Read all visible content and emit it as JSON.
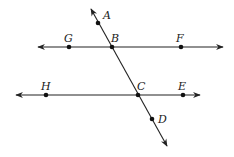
{
  "diagram": {
    "title": "",
    "colors": {
      "line": "#222222",
      "point": "#111111",
      "background": "#ffffff"
    },
    "lines": [
      {
        "id": "line-GF",
        "from": [
          38,
          47
        ],
        "to": [
          223,
          47
        ],
        "arrows": "both"
      },
      {
        "id": "line-HE",
        "from": [
          16,
          95
        ],
        "to": [
          200,
          95
        ],
        "arrows": "both"
      },
      {
        "id": "transversal-AD",
        "from": [
          91,
          9
        ],
        "to": [
          167,
          146
        ],
        "arrows": "both"
      }
    ],
    "points": [
      {
        "name": "A",
        "x": 98,
        "y": 23,
        "label": "A",
        "lx": 103,
        "ly": 19
      },
      {
        "name": "G",
        "x": 69,
        "y": 47,
        "label": "G",
        "lx": 64,
        "ly": 42
      },
      {
        "name": "B",
        "x": 112,
        "y": 47,
        "label": "B",
        "lx": 111,
        "ly": 42
      },
      {
        "name": "F",
        "x": 181,
        "y": 47,
        "label": "F",
        "lx": 176,
        "ly": 42
      },
      {
        "name": "H",
        "x": 46,
        "y": 95,
        "label": "H",
        "lx": 41,
        "ly": 90
      },
      {
        "name": "C",
        "x": 138,
        "y": 95,
        "label": "C",
        "lx": 137,
        "ly": 90
      },
      {
        "name": "E",
        "x": 183,
        "y": 95,
        "label": "E",
        "lx": 178,
        "ly": 90
      },
      {
        "name": "D",
        "x": 152,
        "y": 119,
        "label": "D",
        "lx": 158,
        "ly": 123
      }
    ]
  }
}
